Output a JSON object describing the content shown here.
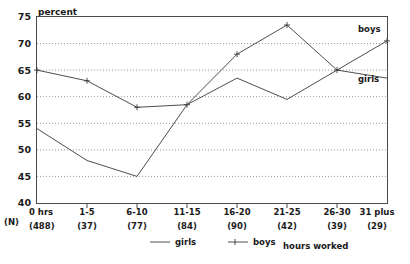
{
  "chart_data": {
    "type": "line",
    "title": "",
    "ylabel": "percent",
    "xlabel": "hours worked",
    "ylim": [
      40,
      75
    ],
    "yticks": [
      40,
      45,
      50,
      55,
      60,
      65,
      70,
      75
    ],
    "grid": true,
    "legend_position": "bottom",
    "categories": [
      "0 hrs",
      "1-5",
      "6-10",
      "11-15",
      "16-20",
      "21-25",
      "26-30",
      "31 plus"
    ],
    "n_label": "(N)",
    "n_values": [
      "(488)",
      "(37)",
      "(77)",
      "(84)",
      "(90)",
      "(42)",
      "(39)",
      "(29)"
    ],
    "series": [
      {
        "name": "girls",
        "marker": "none",
        "end_label": "girls",
        "values": [
          54,
          48,
          45,
          58.5,
          63.5,
          59.5,
          65,
          63.5
        ]
      },
      {
        "name": "boys",
        "marker": "plus",
        "end_label": "boys",
        "values": [
          65,
          63,
          58,
          58.5,
          68,
          73.5,
          65,
          70.5
        ]
      }
    ],
    "legend": [
      {
        "label": "girls",
        "marker": "none"
      },
      {
        "label": "boys",
        "marker": "plus"
      }
    ],
    "colors": {
      "line": "#3a3a3a",
      "grid": "#6b6b6b",
      "border": "#4a4a4a",
      "text": "#1a1a1a",
      "background": "#ffffff"
    }
  }
}
